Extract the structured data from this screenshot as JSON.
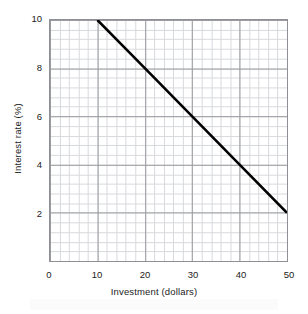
{
  "chart_data": {
    "type": "line",
    "title": "",
    "xlabel": "Investment (dollars)",
    "ylabel": "Interest rate (%)",
    "xlim": [
      0,
      50
    ],
    "ylim": [
      0,
      10
    ],
    "xticks": [
      0,
      10,
      20,
      30,
      40,
      50
    ],
    "yticks": [
      2,
      4,
      6,
      8,
      10
    ],
    "xtick_labels": [
      "0",
      "10",
      "20",
      "30",
      "40",
      "50"
    ],
    "ytick_labels": [
      "2",
      "4",
      "6",
      "8",
      "10"
    ],
    "grid": true,
    "grid_major_x_step": 10,
    "grid_minor_x_step": 2,
    "grid_major_y_step": 2,
    "grid_minor_y_step": 0.4,
    "legend": null,
    "series": [
      {
        "name": "Investment demand",
        "x": [
          10,
          20,
          30,
          40,
          50
        ],
        "y": [
          10,
          8,
          6,
          4,
          2
        ],
        "color": "#000000",
        "line_width": 2.6,
        "markers": false
      }
    ],
    "annotations": []
  },
  "style": {
    "background": "#ffffff",
    "frame_color": "#8f9095",
    "major_grid_color": "#9a9ba0",
    "minor_grid_color": "#d8d9dd",
    "text_color": "#1c1c1c",
    "line_color": "#000000"
  },
  "axes": {
    "x_tick_labels": [
      "0",
      "10",
      "20",
      "30",
      "40",
      "50"
    ],
    "y_tick_labels": [
      "2",
      "4",
      "6",
      "8",
      "10"
    ],
    "x_title": "Investment (dollars)",
    "y_title": "Interest rate (%)"
  }
}
